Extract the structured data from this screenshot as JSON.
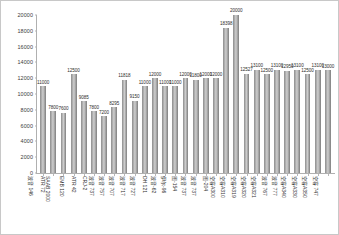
{
  "chart_data": {
    "type": "bar",
    "title": "",
    "xlabel": "",
    "ylabel": "",
    "ylim": [
      0,
      20000
    ],
    "ytick_step": 2000,
    "grid": false,
    "legend": "none",
    "bar_color": "#a6a6a6",
    "yticks": [
      "0",
      "2000",
      "4000",
      "6000",
      "8000",
      "10000",
      "12000",
      "14000",
      "16000",
      "18000",
      "20000"
    ],
    "categories": [
      "波音 146",
      "ATR 72",
      "SAAB 2000",
      "EMB 120",
      "ATR 42",
      "CRJ-2",
      "波音 737",
      "波音 757",
      "波音 707",
      "波音 717",
      "波音 727",
      "DH 121",
      "波音-62",
      "伊尔-96",
      "图-154",
      "波音 737",
      "波音 737",
      "图-204",
      "空客A300",
      "空客A310",
      "空客A319",
      "空客A320",
      "空客A321",
      "波音 767",
      "波音 777",
      "空客A340",
      "空客A330",
      "空客A350",
      "空客 747"
    ],
    "values": [
      11000,
      7800,
      7600,
      12500,
      9085,
      7800,
      7200,
      8295,
      11818,
      9150,
      11000,
      12000,
      11000,
      11000,
      12000,
      11800,
      12000,
      12000,
      18398,
      20000,
      12527,
      13100,
      12500,
      13100,
      12950,
      13100,
      12500,
      13100,
      13000
    ],
    "labels": [
      "11000",
      "7800",
      "7600",
      "12500",
      "9085",
      "7800",
      "7200",
      "8295",
      "11818",
      "9150",
      "11000",
      "12000",
      "11000",
      "11000",
      "12000",
      "11800",
      "12000",
      "12000",
      "18398",
      "20000",
      "12527",
      "13100",
      "12500",
      "13100",
      "12950",
      "13100",
      "12500",
      "13100",
      "13000"
    ]
  }
}
